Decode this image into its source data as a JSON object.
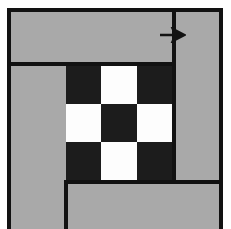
{
  "figure": {
    "canvas": {
      "width": 231,
      "height": 229
    },
    "colors": {
      "background": "#ffffff",
      "field_gray": "#a9a9a9",
      "line_black": "#121212",
      "cell_dark": "#1c1c1c",
      "cell_light": "#fdfdfd"
    }
  },
  "frame": {
    "name": "outer-frame",
    "x": 7,
    "y": 8,
    "width": 216,
    "height": 221,
    "border_width": 4
  },
  "rules": [
    {
      "name": "upper-horizontal-rule",
      "orientation": "horizontal",
      "x": 7,
      "y": 62,
      "length": 169,
      "thickness": 4
    },
    {
      "name": "main-vertical-rule",
      "orientation": "vertical",
      "x": 172,
      "y": 8,
      "length": 176,
      "thickness": 4
    },
    {
      "name": "lower-horizontal-rule",
      "orientation": "horizontal",
      "x": 64,
      "y": 180,
      "length": 159,
      "thickness": 4
    },
    {
      "name": "lower-vertical-rule",
      "orientation": "vertical",
      "x": 64,
      "y": 180,
      "length": 49,
      "thickness": 4
    }
  ],
  "checkerboard": {
    "name": "checkerboard",
    "x": 66,
    "y": 66,
    "width": 106,
    "height": 114,
    "rows": 3,
    "cols": 3,
    "pattern": [
      [
        "dark",
        "light",
        "dark"
      ],
      [
        "light",
        "dark",
        "light"
      ],
      [
        "dark",
        "light",
        "dark"
      ]
    ],
    "cells": [
      {
        "row": 0,
        "col": 0,
        "shade": "dark"
      },
      {
        "row": 0,
        "col": 1,
        "shade": "light"
      },
      {
        "row": 0,
        "col": 2,
        "shade": "dark"
      },
      {
        "row": 1,
        "col": 0,
        "shade": "light"
      },
      {
        "row": 1,
        "col": 1,
        "shade": "dark"
      },
      {
        "row": 1,
        "col": 2,
        "shade": "light"
      },
      {
        "row": 2,
        "col": 0,
        "shade": "dark"
      },
      {
        "row": 2,
        "col": 1,
        "shade": "light"
      },
      {
        "row": 2,
        "col": 2,
        "shade": "dark"
      }
    ]
  },
  "arrow": {
    "name": "direction-arrow",
    "direction": "right",
    "x": 160,
    "y": 27,
    "width": 26,
    "height": 16,
    "color": "#121212"
  }
}
